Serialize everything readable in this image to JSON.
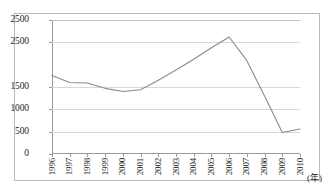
{
  "chart_data": {
    "type": "line",
    "title": "",
    "subtitle": "",
    "xlabel": "(年)",
    "ylabel": "",
    "grid": true,
    "legend": false,
    "legend_position": "none",
    "xlim": [
      1996,
      2010
    ],
    "ylim": [
      0,
      3000
    ],
    "x": [
      1996,
      1997,
      1998,
      1999,
      2000,
      2001,
      2002,
      2003,
      2004,
      2005,
      2006,
      2007,
      2008,
      2009,
      2010
    ],
    "xtick_labels": [
      "1996",
      "1997",
      "1998",
      "1999",
      "2000",
      "2001",
      "2002",
      "2003",
      "2004",
      "2005",
      "2006",
      "2007",
      "2008",
      "2009",
      "2010"
    ],
    "ytick_labels": [
      "2500",
      "2500",
      "1500",
      "1000",
      "500",
      "0"
    ],
    "ytick_values": [
      3000,
      2500,
      1500,
      1000,
      500,
      0
    ],
    "series": [
      {
        "name": "series-1",
        "color": "#8a8a8a",
        "values": [
          1760,
          1600,
          1590,
          1470,
          1400,
          1440,
          1650,
          1880,
          2120,
          2380,
          2620,
          2090,
          1300,
          480,
          560
        ]
      }
    ]
  },
  "axis": {
    "x_unit": "(年)"
  }
}
